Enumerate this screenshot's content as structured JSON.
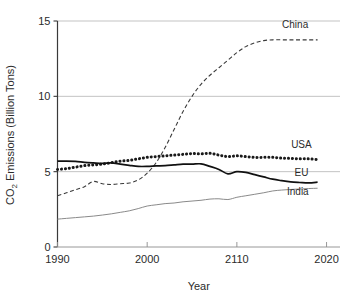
{
  "chart_data": {
    "type": "line",
    "title": "",
    "xlabel": "Year",
    "ylabel": "CO2 Emissions (Billion Tons)",
    "ylabel_prefix": "CO",
    "ylabel_subscript": "2",
    "ylabel_suffix": " Emissions (Billion Tons)",
    "xlim": [
      1990,
      2021.5
    ],
    "ylim": [
      0,
      15
    ],
    "grid": "horizontal",
    "legend_position": "inline-right",
    "x_tick_labels": [
      "1990",
      "2000",
      "2110",
      "2020"
    ],
    "x_tick_values": [
      1990,
      2000,
      2010,
      2020
    ],
    "y_tick_labels": [
      "0",
      "5",
      "10",
      "15"
    ],
    "y_tick_values": [
      0,
      5,
      10,
      15
    ],
    "x": [
      1990,
      1991,
      1992,
      1993,
      1994,
      1995,
      1996,
      1997,
      1998,
      1999,
      2000,
      2001,
      2002,
      2003,
      2004,
      2005,
      2006,
      2007,
      2008,
      2009,
      2010,
      2011,
      2012,
      2013,
      2014,
      2015,
      2016,
      2017,
      2018,
      2019
    ],
    "series": [
      {
        "name": "China",
        "label": "China",
        "style": "dashed",
        "color": "#3a3a3a",
        "width": 1.1,
        "values": [
          3.4,
          3.6,
          3.8,
          4.0,
          4.35,
          4.2,
          4.15,
          4.2,
          4.25,
          4.45,
          4.9,
          5.6,
          6.6,
          7.8,
          9.0,
          10.0,
          10.8,
          11.4,
          11.9,
          12.4,
          12.9,
          13.3,
          13.55,
          13.7,
          13.75,
          13.75,
          13.75,
          13.75,
          13.75,
          13.75
        ]
      },
      {
        "name": "USA",
        "label": "USA",
        "style": "dotted",
        "color": "#1a1a1a",
        "width": 3.0,
        "values": [
          5.15,
          5.2,
          5.3,
          5.4,
          5.45,
          5.5,
          5.6,
          5.7,
          5.75,
          5.85,
          5.95,
          6.0,
          6.05,
          6.1,
          6.15,
          6.2,
          6.18,
          6.22,
          6.1,
          6.0,
          6.05,
          6.0,
          5.95,
          5.95,
          5.95,
          5.9,
          5.88,
          5.85,
          5.85,
          5.8
        ]
      },
      {
        "name": "EU",
        "label": "EU",
        "style": "solid",
        "color": "#111111",
        "width": 1.7,
        "values": [
          5.7,
          5.7,
          5.68,
          5.62,
          5.58,
          5.55,
          5.58,
          5.5,
          5.42,
          5.35,
          5.35,
          5.38,
          5.4,
          5.45,
          5.5,
          5.5,
          5.52,
          5.35,
          5.15,
          4.85,
          5.0,
          4.95,
          4.8,
          4.65,
          4.5,
          4.4,
          4.32,
          4.28,
          4.25,
          4.3
        ]
      },
      {
        "name": "India",
        "label": "India",
        "style": "solid",
        "color": "#8a8a8a",
        "width": 1.0,
        "values": [
          1.85,
          1.9,
          1.95,
          2.0,
          2.05,
          2.12,
          2.2,
          2.3,
          2.4,
          2.55,
          2.72,
          2.8,
          2.88,
          2.92,
          3.0,
          3.05,
          3.1,
          3.18,
          3.2,
          3.15,
          3.3,
          3.4,
          3.5,
          3.6,
          3.72,
          3.78,
          3.82,
          3.85,
          3.88,
          3.9
        ]
      }
    ],
    "annotations": [
      {
        "text": "China",
        "x": 2016.5,
        "y": 14.55
      },
      {
        "text": "USA",
        "x": 2017.2,
        "y": 6.55
      },
      {
        "text": "EU",
        "x": 2017.2,
        "y": 4.72
      },
      {
        "text": "India",
        "x": 2016.8,
        "y": 3.42
      }
    ]
  },
  "figure": {
    "background_color": "#ffffff",
    "grid_color": "#bcbcbc",
    "axis_color": "#3a3a3a"
  }
}
